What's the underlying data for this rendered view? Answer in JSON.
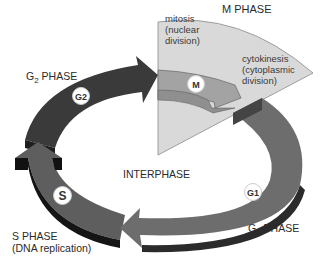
{
  "diagram": {
    "type": "cell-cycle",
    "center_label": "INTERPHASE",
    "phases": [
      {
        "id": "m",
        "title": "M PHASE",
        "badge": "M",
        "sublabels": [
          "mitosis",
          "(nuclear",
          "division)"
        ],
        "sublabels2": [
          "cytokinesis",
          "(cytoplasmic",
          "division)"
        ],
        "color": "#a3a3a3",
        "wedge_color": "#d9d9d9"
      },
      {
        "id": "g1",
        "title_main": "G",
        "title_sub": "1",
        "title_rest": " PHASE",
        "badge": "G1",
        "color": "#6d6d6d"
      },
      {
        "id": "s",
        "title": "S PHASE",
        "subtitle": "(DNA replication)",
        "badge": "S",
        "color": "#5e5e5e"
      },
      {
        "id": "g2",
        "title_main": "G",
        "title_sub": "2",
        "title_rest": " PHASE",
        "badge": "G2",
        "color": "#3a3a3a"
      }
    ]
  }
}
